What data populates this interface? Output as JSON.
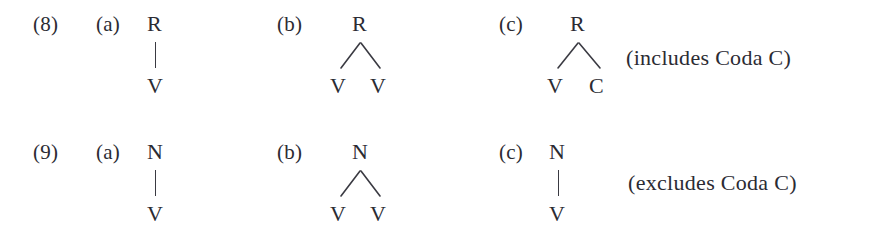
{
  "figure": {
    "background_color": "#ffffff",
    "ink_color": "#2b2b33",
    "examples": [
      {
        "number": "(8)",
        "items": [
          {
            "label": "(a)",
            "root": "R",
            "children": [
              "V"
            ],
            "shape": "single-vertical-branch"
          },
          {
            "label": "(b)",
            "root": "R",
            "children": [
              "V",
              "V"
            ],
            "shape": "two-branch"
          },
          {
            "label": "(c)",
            "root": "R",
            "children": [
              "V",
              "C"
            ],
            "shape": "two-branch",
            "comment": "(includes Coda C)"
          }
        ]
      },
      {
        "number": "(9)",
        "items": [
          {
            "label": "(a)",
            "root": "N",
            "children": [
              "V"
            ],
            "shape": "single-vertical-branch"
          },
          {
            "label": "(b)",
            "root": "N",
            "children": [
              "V",
              "V"
            ],
            "shape": "two-branch"
          },
          {
            "label": "(c)",
            "root": "N",
            "children": [
              "V"
            ],
            "shape": "single-vertical-branch",
            "comment": "(excludes Coda C)"
          }
        ]
      }
    ]
  }
}
